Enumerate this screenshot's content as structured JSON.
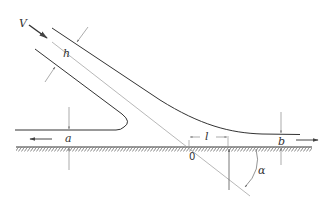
{
  "diagram": {
    "labels": {
      "velocity": "V",
      "jet_thickness": "h",
      "left_stream": "a",
      "right_stream": "b",
      "length": "l",
      "origin": "0",
      "angle": "α"
    },
    "colors": {
      "line": "#333333",
      "thin_line": "#888888",
      "background": "#ffffff"
    }
  }
}
